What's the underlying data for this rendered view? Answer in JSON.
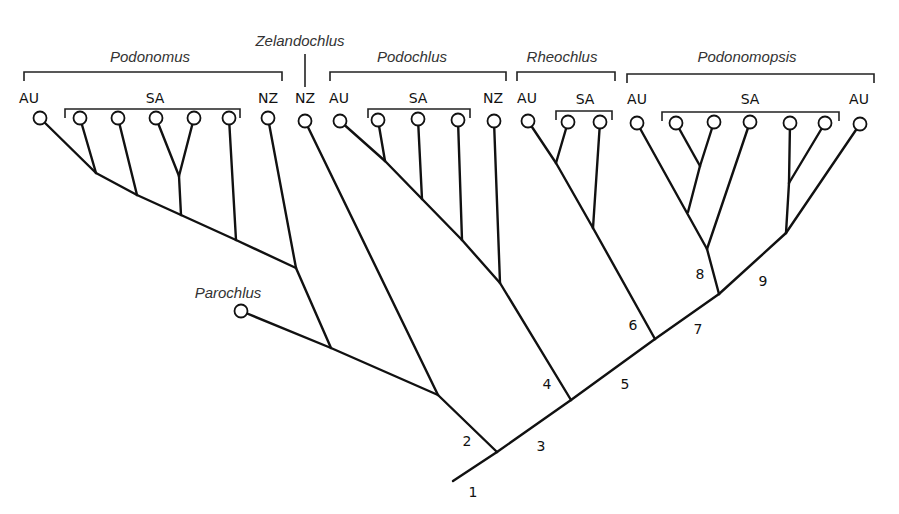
{
  "diagram": {
    "type": "cladogram",
    "genera": [
      {
        "name": "Podonomus",
        "label_x": 150,
        "label_y": 62,
        "bracket": [
          24,
          282,
          72
        ]
      },
      {
        "name": "Zelandochlus",
        "label_x": 300,
        "label_y": 46,
        "bracket": null
      },
      {
        "name": "Podochlus",
        "label_x": 412,
        "label_y": 62,
        "bracket": [
          330,
          506,
          72
        ]
      },
      {
        "name": "Rheochlus",
        "label_x": 562,
        "label_y": 62,
        "bracket": [
          517,
          615,
          72
        ]
      },
      {
        "name": "Podonomopsis",
        "label_x": 747,
        "label_y": 62,
        "bracket": [
          627,
          874,
          74
        ]
      }
    ],
    "regions": [
      {
        "label": "AU",
        "x": 29,
        "y": 103
      },
      {
        "label": "SA",
        "x": 155,
        "y": 103,
        "bracket": [
          65,
          240,
          109
        ]
      },
      {
        "label": "NZ",
        "x": 268,
        "y": 103
      },
      {
        "label": "NZ",
        "x": 305,
        "y": 103
      },
      {
        "label": "AU",
        "x": 339,
        "y": 103
      },
      {
        "label": "SA",
        "x": 418,
        "y": 103,
        "bracket": [
          368,
          470,
          109
        ]
      },
      {
        "label": "NZ",
        "x": 493,
        "y": 103
      },
      {
        "label": "AU",
        "x": 527,
        "y": 103
      },
      {
        "label": "SA",
        "x": 585,
        "y": 104,
        "bracket": [
          556,
          612,
          111
        ]
      },
      {
        "label": "AU",
        "x": 637,
        "y": 104
      },
      {
        "label": "SA",
        "x": 750,
        "y": 104,
        "bracket": [
          662,
          839,
          112
        ]
      },
      {
        "label": "AU",
        "x": 859,
        "y": 104
      }
    ],
    "outgroup": {
      "name": "Parochlus",
      "label_x": 228,
      "label_y": 298,
      "circle": [
        241,
        311
      ]
    },
    "leaves": [
      [
        40,
        118
      ],
      [
        80,
        118
      ],
      [
        118,
        118
      ],
      [
        156,
        118
      ],
      [
        194,
        118
      ],
      [
        229,
        118
      ],
      [
        268,
        118
      ],
      [
        305,
        121
      ],
      [
        340,
        121
      ],
      [
        378,
        120
      ],
      [
        418,
        119
      ],
      [
        458,
        120
      ],
      [
        494,
        121
      ],
      [
        528,
        121
      ],
      [
        568,
        122
      ],
      [
        600,
        122
      ],
      [
        637,
        123
      ],
      [
        676,
        123
      ],
      [
        714,
        122
      ],
      [
        750,
        122
      ],
      [
        790,
        123
      ],
      [
        825,
        123
      ],
      [
        860,
        124
      ]
    ],
    "branches": [
      [
        40,
        118,
        96,
        173
      ],
      [
        80,
        118,
        96,
        173
      ],
      [
        96,
        173,
        137,
        195
      ],
      [
        118,
        118,
        137,
        195
      ],
      [
        137,
        195,
        181,
        215
      ],
      [
        156,
        118,
        179,
        176
      ],
      [
        194,
        118,
        179,
        176
      ],
      [
        179,
        176,
        181,
        215
      ],
      [
        181,
        215,
        236,
        240
      ],
      [
        229,
        118,
        236,
        240
      ],
      [
        236,
        240,
        296,
        268
      ],
      [
        268,
        118,
        296,
        268
      ],
      [
        296,
        268,
        331,
        348
      ],
      [
        241,
        311,
        331,
        348
      ],
      [
        331,
        348,
        438,
        395
      ],
      [
        305,
        121,
        438,
        395
      ],
      [
        438,
        395,
        497,
        452
      ],
      [
        340,
        121,
        385,
        161
      ],
      [
        378,
        120,
        385,
        161
      ],
      [
        385,
        161,
        422,
        199
      ],
      [
        418,
        119,
        422,
        199
      ],
      [
        422,
        199,
        462,
        240
      ],
      [
        458,
        120,
        462,
        240
      ],
      [
        462,
        240,
        500,
        283
      ],
      [
        494,
        121,
        500,
        283
      ],
      [
        500,
        283,
        571,
        400
      ],
      [
        528,
        121,
        556,
        163
      ],
      [
        568,
        122,
        556,
        163
      ],
      [
        556,
        163,
        593,
        228
      ],
      [
        600,
        122,
        593,
        228
      ],
      [
        593,
        228,
        655,
        339
      ],
      [
        637,
        123,
        707,
        249
      ],
      [
        676,
        123,
        700,
        166
      ],
      [
        714,
        122,
        700,
        166
      ],
      [
        700,
        166,
        688,
        212
      ],
      [
        750,
        122,
        707,
        249
      ],
      [
        707,
        249,
        719,
        294
      ],
      [
        790,
        123,
        789,
        183
      ],
      [
        825,
        123,
        789,
        183
      ],
      [
        789,
        183,
        786,
        233
      ],
      [
        860,
        124,
        786,
        233
      ],
      [
        453,
        481,
        497,
        452
      ],
      [
        497,
        452,
        571,
        400
      ],
      [
        571,
        400,
        655,
        339
      ],
      [
        655,
        339,
        719,
        294
      ],
      [
        719,
        294,
        786,
        233
      ]
    ],
    "node_labels": [
      {
        "num": "1",
        "x": 473,
        "y": 497
      },
      {
        "num": "2",
        "x": 467,
        "y": 446
      },
      {
        "num": "3",
        "x": 541,
        "y": 451
      },
      {
        "num": "4",
        "x": 547,
        "y": 389
      },
      {
        "num": "5",
        "x": 625,
        "y": 389
      },
      {
        "num": "6",
        "x": 633,
        "y": 330
      },
      {
        "num": "7",
        "x": 698,
        "y": 334
      },
      {
        "num": "8",
        "x": 700,
        "y": 279
      },
      {
        "num": "9",
        "x": 763,
        "y": 286
      }
    ]
  }
}
